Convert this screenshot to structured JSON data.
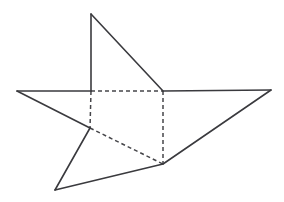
{
  "figure": {
    "background_color": "#ffffff",
    "solid_stroke_color": "#3a3a3e",
    "hidden_stroke_color": "#46464a",
    "solid_stroke_width": 1.6,
    "hidden_stroke_width": 1.5,
    "hidden_dash_pattern": "4 3",
    "canvas": {
      "width": 284,
      "height": 202
    }
  },
  "points": {
    "apex_top": {
      "x": 91,
      "y": 14
    },
    "inner_top_left": {
      "x": 91,
      "y": 91
    },
    "inner_top_right": {
      "x": 163,
      "y": 91
    },
    "tip_left": {
      "x": 17,
      "y": 91
    },
    "tip_right": {
      "x": 271,
      "y": 90
    },
    "inner_left": {
      "x": 90,
      "y": 128
    },
    "inner_bottom": {
      "x": 163,
      "y": 164
    },
    "tip_bottom_left": {
      "x": 55,
      "y": 190
    }
  },
  "edges": {
    "solid": [
      {
        "name": "apex-to-inner-top-left",
        "d": "M 91 14 L 91 91"
      },
      {
        "name": "apex-to-inner-top-right",
        "d": "M 91 14 L 163 91"
      },
      {
        "name": "inner-top-left-to-tip-left",
        "d": "M 91 91 L 17 91"
      },
      {
        "name": "inner-top-right-to-tip-right",
        "d": "M 163 91 L 271 90"
      },
      {
        "name": "tip-left-to-inner-left",
        "d": "M 17 91 L 90 128"
      },
      {
        "name": "inner-left-to-tip-bottom-left",
        "d": "M 90 128 L 55 190"
      },
      {
        "name": "tip-bottom-left-to-inner-bottom",
        "d": "M 55 190 L 163 164"
      },
      {
        "name": "inner-bottom-to-tip-right",
        "d": "M 163 164 L 271 90"
      }
    ],
    "hidden": [
      {
        "name": "inner-top-left-to-inner-top-right",
        "d": "M 91 91 L 163 91"
      },
      {
        "name": "inner-top-right-to-inner-bottom",
        "d": "M 163 91 L 163 164"
      },
      {
        "name": "inner-top-left-to-inner-left",
        "d": "M 91 91 L 90 128"
      },
      {
        "name": "inner-left-to-inner-bottom",
        "d": "M 90 128 L 163 164"
      }
    ]
  }
}
